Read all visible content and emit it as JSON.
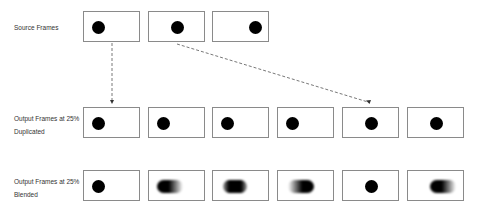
{
  "rows": {
    "source": {
      "label_line1": "Source Frames",
      "label_line2": ""
    },
    "duplicated": {
      "label_line1": "Output Frames at 25%",
      "label_line2": "Duplicated"
    },
    "blended": {
      "label_line1": "Output Frames at 25%",
      "label_line2": "Blended"
    }
  },
  "frames": {
    "source": [
      {
        "dot": "left"
      },
      {
        "dot": "center"
      },
      {
        "dot": "right"
      }
    ],
    "duplicated": [
      {
        "dot": "left"
      },
      {
        "dot": "left"
      },
      {
        "dot": "left"
      },
      {
        "dot": "left"
      },
      {
        "dot": "center"
      },
      {
        "dot": "center"
      }
    ],
    "blended": [
      {
        "dot": "left",
        "blur": "none"
      },
      {
        "dot": "left-motion",
        "blur": "trailing-right"
      },
      {
        "dot": "middle",
        "blur": "both-sides"
      },
      {
        "dot": "center-motion",
        "blur": "leading-left"
      },
      {
        "dot": "center",
        "blur": "none"
      },
      {
        "dot": "center-motion",
        "blur": "trailing-right"
      }
    ]
  },
  "arrows": [
    {
      "from": "source-frame-1",
      "to": "duplicated-frame-1",
      "style": "dashed"
    },
    {
      "from": "source-frame-2",
      "to": "duplicated-frame-5",
      "style": "dashed"
    }
  ],
  "colors": {
    "frame_border": "#8a8a8a",
    "dot": "#000000",
    "arrow": "#555555"
  }
}
